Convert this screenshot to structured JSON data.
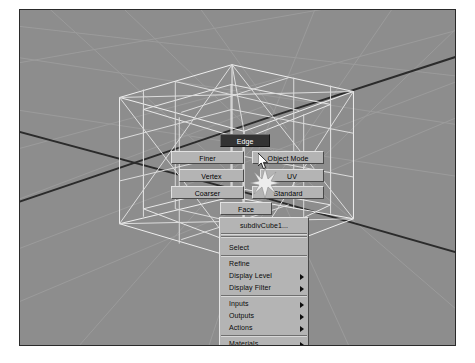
{
  "app": {
    "name": "maya-viewport",
    "viewport_background": "#8d8d8d",
    "wireframe_color": "#f2f2f2",
    "grid_color": "#9a9a9a",
    "axis_color": "#2b2b2b",
    "menu_face_color": "#b4b4b4",
    "selected_color": "#333333"
  },
  "marking_menu": {
    "name": "subdiv-component-marking-menu",
    "items": [
      {
        "id": "edge",
        "label": "Edge",
        "selected": true
      },
      {
        "id": "finer",
        "label": "Finer",
        "selected": false
      },
      {
        "id": "object-mode",
        "label": "Object Mode",
        "selected": false
      },
      {
        "id": "vertex",
        "label": "Vertex",
        "selected": false
      },
      {
        "id": "uv",
        "label": "UV",
        "selected": false
      },
      {
        "id": "coarser",
        "label": "Coarser",
        "selected": false
      },
      {
        "id": "standard",
        "label": "Standard",
        "selected": false
      },
      {
        "id": "face",
        "label": "Face",
        "selected": false
      }
    ]
  },
  "context_menu": {
    "name": "subdiv-context-menu",
    "title": "subdivCube1...",
    "items": [
      {
        "id": "select",
        "label": "Select",
        "submenu": false
      },
      {
        "id": "refine",
        "label": "Refine",
        "submenu": false
      },
      {
        "id": "display-level",
        "label": "Display Level",
        "submenu": true
      },
      {
        "id": "display-filter",
        "label": "Display Filter",
        "submenu": true
      },
      {
        "id": "inputs",
        "label": "Inputs",
        "submenu": true
      },
      {
        "id": "outputs",
        "label": "Outputs",
        "submenu": true
      },
      {
        "id": "actions",
        "label": "Actions",
        "submenu": true
      },
      {
        "id": "materials",
        "label": "Materials",
        "submenu": true
      }
    ]
  },
  "cursor": {
    "name": "mouse-pointer",
    "x": 238,
    "y": 143
  }
}
